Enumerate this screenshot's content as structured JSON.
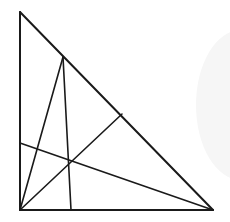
{
  "diagram": {
    "type": "geometry",
    "stroke_color": "#1a1a1a",
    "background_color": "#ffffff",
    "faint_shape_color": "#f6f6f6",
    "points": {
      "A": {
        "role": "top vertex"
      },
      "C": {
        "role": "right-angle vertex"
      },
      "B": {
        "role": "bottom-right vertex"
      },
      "D": {
        "role": "point on hypotenuse AB near A"
      },
      "E": {
        "role": "point on base CB"
      },
      "F": {
        "role": "point on hypotenuse AB"
      },
      "G": {
        "role": "point on side AC"
      }
    },
    "segments": [
      {
        "id": "AC",
        "from": "A",
        "to": "C",
        "kind": "side"
      },
      {
        "id": "CB",
        "from": "C",
        "to": "B",
        "kind": "side"
      },
      {
        "id": "AB",
        "from": "A",
        "to": "B",
        "kind": "hypotenuse"
      },
      {
        "id": "CD",
        "from": "C",
        "to": "D",
        "kind": "cevian"
      },
      {
        "id": "DE",
        "from": "D",
        "to": "E",
        "kind": "cevian"
      },
      {
        "id": "CF",
        "from": "C",
        "to": "F",
        "kind": "cevian"
      },
      {
        "id": "GB",
        "from": "G",
        "to": "B",
        "kind": "cevian"
      }
    ],
    "labels": []
  }
}
